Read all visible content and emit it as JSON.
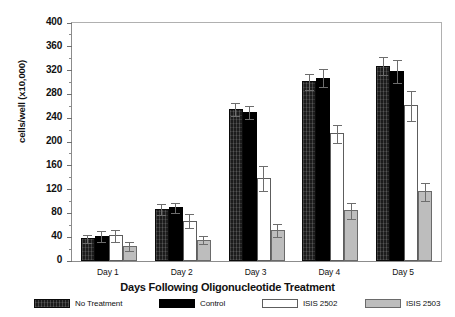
{
  "chart_data": {
    "type": "bar",
    "title": "",
    "xlabel": "Days Following Oligonucleotide Treatment",
    "ylabel": "cells/well (x10,000)",
    "categories": [
      "Day 1",
      "Day 2",
      "Day 3",
      "Day 4",
      "Day 5"
    ],
    "ylim": [
      0,
      400
    ],
    "yticks": [
      0,
      40,
      80,
      120,
      160,
      200,
      240,
      280,
      320,
      360,
      400
    ],
    "ytick_labels": [
      "0",
      "40",
      "80",
      "120",
      "160",
      "200",
      "240",
      "280",
      "320",
      "360",
      "400"
    ],
    "grid": false,
    "legend_position": "below-axes",
    "series": [
      {
        "name": "No Treatment",
        "key": "notreatment",
        "fill": "#1c1c1c",
        "pattern": "dark-textured",
        "values": [
          38,
          88,
          255,
          302,
          328
        ],
        "errors": [
          8,
          10,
          12,
          14,
          16
        ]
      },
      {
        "name": "Control",
        "key": "control",
        "fill": "#000000",
        "pattern": "solid-black",
        "values": [
          42,
          90,
          250,
          308,
          320
        ],
        "errors": [
          10,
          10,
          12,
          16,
          20
        ]
      },
      {
        "name": "ISIS 2502",
        "key": "2502",
        "fill": "#ffffff",
        "pattern": "open",
        "values": [
          43,
          68,
          140,
          215,
          262
        ],
        "errors": [
          11,
          13,
          22,
          16,
          26
        ]
      },
      {
        "name": "ISIS 2503",
        "key": "2503",
        "fill": "#bdbdbd",
        "pattern": "light-gray",
        "values": [
          25,
          36,
          52,
          85,
          117
        ],
        "errors": [
          9,
          8,
          12,
          15,
          16
        ]
      }
    ]
  },
  "legend": {
    "items": [
      {
        "label": "No Treatment",
        "key": "notreatment"
      },
      {
        "label": "Control",
        "key": "control"
      },
      {
        "label": "ISIS 2502",
        "key": "2502"
      },
      {
        "label": "ISIS 2503",
        "key": "2503"
      }
    ]
  }
}
